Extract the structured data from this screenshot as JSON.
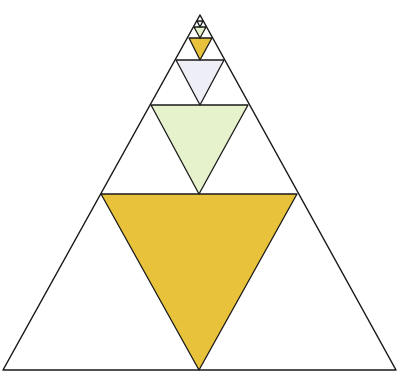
{
  "figure": {
    "stroke_color": "#1a1a1a",
    "background": "#ffffff",
    "outer_triangle": {
      "apex": [
        200,
        15
      ],
      "left": [
        3,
        370
      ],
      "right": [
        396,
        370
      ]
    },
    "levels": [
      {
        "name": "level-1",
        "midline_y": 194,
        "midline_x": [
          101,
          297
        ],
        "inverted_bottom": [
          199,
          370
        ],
        "fill": "#E8C23A",
        "fill_name": "yellow"
      },
      {
        "name": "level-2",
        "midline_y": 105,
        "midline_x": [
          151,
          248
        ],
        "inverted_bottom": [
          199,
          194
        ],
        "fill": "#E6F2CC",
        "fill_name": "pale-green"
      },
      {
        "name": "level-3",
        "midline_y": 60,
        "midline_x": [
          176,
          224
        ],
        "inverted_bottom": [
          200,
          105
        ],
        "fill": "#EEEEF6",
        "fill_name": "pale-lavender"
      },
      {
        "name": "level-4",
        "midline_y": 38,
        "midline_x": [
          189,
          212
        ],
        "inverted_bottom": [
          200,
          60
        ],
        "fill": "#E8C23A",
        "fill_name": "yellow"
      },
      {
        "name": "level-5",
        "midline_y": 27,
        "midline_x": [
          194,
          206
        ],
        "inverted_bottom": [
          200,
          38
        ],
        "fill": "#E6F2CC",
        "fill_name": "pale-green"
      },
      {
        "name": "level-6",
        "midline_y": 21,
        "midline_x": [
          197,
          203
        ],
        "inverted_bottom": [
          200,
          27
        ],
        "fill": "#EEEEF6",
        "fill_name": "pale-lavender"
      }
    ]
  }
}
